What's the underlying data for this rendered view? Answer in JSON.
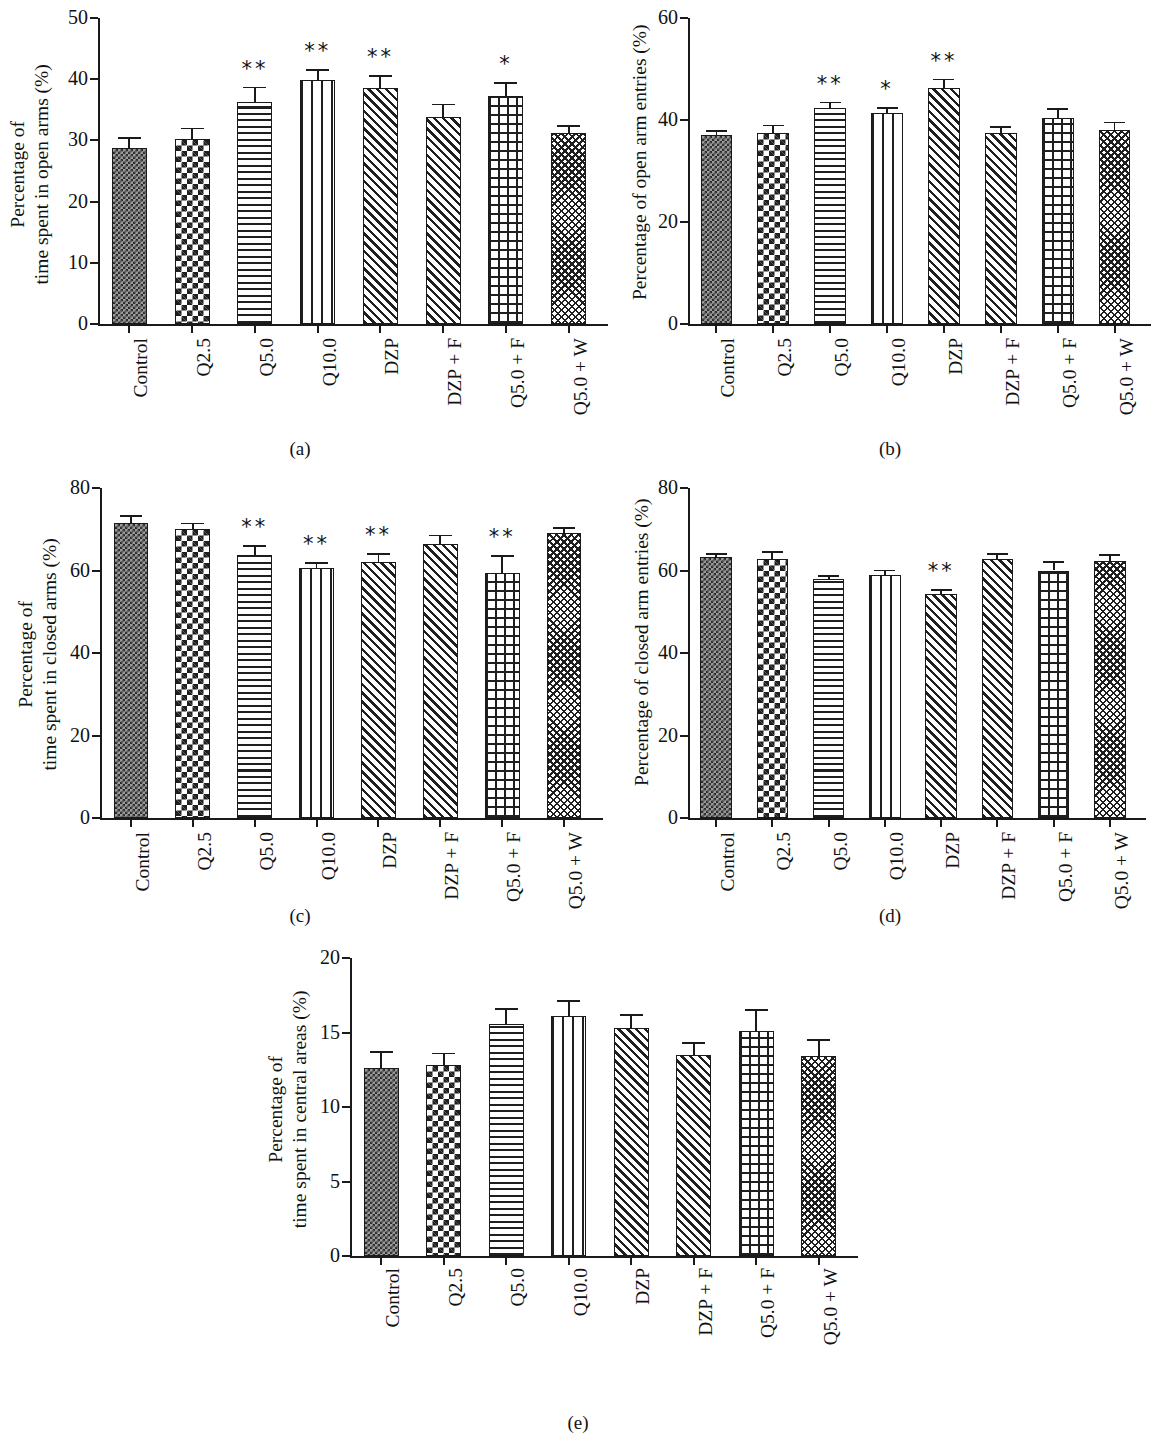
{
  "figure": {
    "panel_captions": [
      "(a)",
      "(b)",
      "(c)",
      "(d)",
      "(e)"
    ],
    "categories": [
      "Control",
      "Q2.5",
      "Q5.0",
      "Q10.0",
      "DZP",
      "DZP + F",
      "Q5.0 + F",
      "Q5.0 + W"
    ],
    "patterns": [
      "check-fine",
      "check-coarse",
      "horiz",
      "vert",
      "diag",
      "diag",
      "grid",
      "weave"
    ]
  },
  "chart_data": [
    {
      "type": "bar",
      "panel": "(a)",
      "title": "",
      "xlabel": "",
      "ylabel": "Percentage of\ntime spent in open arms (%)",
      "ylim": [
        0,
        50
      ],
      "yticks": [
        0,
        10,
        20,
        30,
        40,
        50
      ],
      "ytick_labels": [
        "0",
        "10",
        "20",
        "30",
        "40",
        "50"
      ],
      "grid": false,
      "legend": "none",
      "categories": [
        "Control",
        "Q2.5",
        "Q5.0",
        "Q10.0",
        "DZP",
        "DZP + F",
        "Q5.0 + F",
        "Q5.0 + W"
      ],
      "values": [
        28.7,
        30.2,
        36.3,
        39.8,
        38.5,
        33.9,
        37.2,
        31.2
      ],
      "errors": [
        1.8,
        1.9,
        2.5,
        1.8,
        2.2,
        2.1,
        2.3,
        1.3
      ],
      "annotations": [
        "",
        "",
        "**",
        "**",
        "**",
        "",
        "*",
        ""
      ]
    },
    {
      "type": "bar",
      "panel": "(b)",
      "title": "",
      "xlabel": "",
      "ylabel": "Percentage of open arm entries (%)",
      "ylim": [
        0,
        60
      ],
      "yticks": [
        0,
        20,
        40,
        60
      ],
      "ytick_labels": [
        "0",
        "20",
        "40",
        "60"
      ],
      "grid": false,
      "legend": "none",
      "categories": [
        "Control",
        "Q2.5",
        "Q5.0",
        "Q10.0",
        "DZP",
        "DZP + F",
        "Q5.0 + F",
        "Q5.0 + W"
      ],
      "values": [
        37.0,
        37.5,
        42.3,
        41.3,
        46.3,
        37.5,
        40.3,
        38.1
      ],
      "errors": [
        1.0,
        1.6,
        1.3,
        1.3,
        1.8,
        1.3,
        2.1,
        1.6
      ],
      "annotations": [
        "",
        "",
        "**",
        "*",
        "**",
        "",
        "",
        ""
      ]
    },
    {
      "type": "bar",
      "panel": "(c)",
      "title": "",
      "xlabel": "",
      "ylabel": "Percentage of\ntime spent in closed arms (%)",
      "ylim": [
        0,
        80
      ],
      "yticks": [
        0,
        20,
        40,
        60,
        80
      ],
      "ytick_labels": [
        "0",
        "20",
        "40",
        "60",
        "80"
      ],
      "grid": false,
      "legend": "none",
      "categories": [
        "Control",
        "Q2.5",
        "Q5.0",
        "Q10.0",
        "DZP",
        "DZP + F",
        "Q5.0 + F",
        "Q5.0 + W"
      ],
      "values": [
        71.5,
        70.0,
        63.8,
        60.5,
        62.0,
        66.5,
        59.3,
        69.0
      ],
      "errors": [
        1.9,
        1.6,
        2.3,
        1.5,
        2.2,
        2.2,
        4.4,
        1.5
      ],
      "annotations": [
        "",
        "",
        "**",
        "**",
        "**",
        "",
        "**",
        ""
      ]
    },
    {
      "type": "bar",
      "panel": "(d)",
      "title": "",
      "xlabel": "",
      "ylabel": "Percentage of closed arm entries (%)",
      "ylim": [
        0,
        80
      ],
      "yticks": [
        0,
        20,
        40,
        60,
        80
      ],
      "ytick_labels": [
        "0",
        "20",
        "40",
        "60",
        "80"
      ],
      "grid": false,
      "legend": "none",
      "categories": [
        "Control",
        "Q2.5",
        "Q5.0",
        "Q10.0",
        "DZP",
        "DZP + F",
        "Q5.0 + F",
        "Q5.0 + W"
      ],
      "values": [
        63.2,
        62.8,
        58.0,
        59.0,
        54.2,
        62.8,
        60.0,
        62.3
      ],
      "errors": [
        1.0,
        1.9,
        0.9,
        1.2,
        1.3,
        1.5,
        2.3,
        1.7
      ],
      "annotations": [
        "",
        "",
        "",
        "",
        "**",
        "",
        "",
        ""
      ]
    },
    {
      "type": "bar",
      "panel": "(e)",
      "title": "",
      "xlabel": "",
      "ylabel": "Percentage of\ntime spent in central areas (%)",
      "ylim": [
        0,
        20
      ],
      "yticks": [
        0,
        5,
        10,
        15,
        20
      ],
      "ytick_labels": [
        "0",
        "5",
        "10",
        "15",
        "20"
      ],
      "grid": false,
      "legend": "none",
      "categories": [
        "Control",
        "Q2.5",
        "Q5.0",
        "Q10.0",
        "DZP",
        "DZP + F",
        "Q5.0 + F",
        "Q5.0 + W"
      ],
      "values": [
        12.6,
        12.8,
        15.6,
        16.1,
        15.3,
        13.5,
        15.1,
        13.4
      ],
      "errors": [
        1.15,
        0.85,
        1.05,
        1.05,
        0.95,
        0.85,
        1.45,
        1.15
      ],
      "annotations": [
        "",
        "",
        "",
        "",
        "",
        "",
        "",
        ""
      ]
    }
  ]
}
